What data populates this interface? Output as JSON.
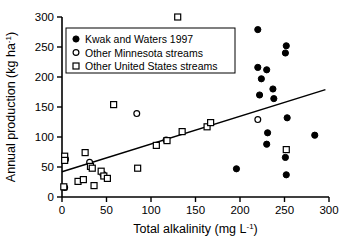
{
  "chart_data": {
    "type": "scatter",
    "title": "",
    "xlabel": "Total alkalinity (mg L-1)",
    "xlabel_base": "Total alkalinity (mg L",
    "xlabel_sup": "-1",
    "xlabel_tail": ")",
    "ylabel": "Annual production (kg ha-1)",
    "ylabel_base": "Annual production (kg ha",
    "ylabel_sup": "-1",
    "ylabel_tail": ")",
    "xlim": [
      0,
      300
    ],
    "ylim": [
      0,
      300
    ],
    "xticks": [
      0,
      50,
      100,
      150,
      200,
      250,
      300
    ],
    "yticks": [
      0,
      50,
      100,
      150,
      200,
      250,
      300
    ],
    "grid": false,
    "legend_position": "upper-left",
    "legend": [
      {
        "label": "Kwak and Waters 1997",
        "marker": "filled-circle"
      },
      {
        "label": "Other Minnesota streams",
        "marker": "open-circle"
      },
      {
        "label": "Other United States streams",
        "marker": "open-square"
      }
    ],
    "series": [
      {
        "name": "Kwak and Waters 1997",
        "marker": "filled-circle",
        "color": "#000000",
        "points": [
          [
            196,
            47
          ],
          [
            220,
            216
          ],
          [
            220,
            279
          ],
          [
            222,
            170
          ],
          [
            224,
            197
          ],
          [
            230,
            212
          ],
          [
            230,
            88
          ],
          [
            231,
            107
          ],
          [
            237,
            180
          ],
          [
            238,
            164
          ],
          [
            251,
            240
          ],
          [
            251,
            66
          ],
          [
            252,
            252
          ],
          [
            252,
            37
          ],
          [
            253,
            132
          ],
          [
            284,
            103
          ]
        ]
      },
      {
        "name": "Other Minnesota streams",
        "marker": "open-circle",
        "color": "#000000",
        "points": [
          [
            3,
            16
          ],
          [
            4,
            63
          ],
          [
            31,
            58
          ],
          [
            46,
            38
          ],
          [
            84,
            139
          ],
          [
            117,
            95
          ],
          [
            220,
            129
          ]
        ]
      },
      {
        "name": "Other United States streams",
        "marker": "open-square",
        "color": "#000000",
        "points": [
          [
            2,
            17
          ],
          [
            3,
            68
          ],
          [
            3,
            61
          ],
          [
            18,
            26
          ],
          [
            24,
            29
          ],
          [
            26,
            74
          ],
          [
            32,
            51
          ],
          [
            34,
            48
          ],
          [
            36,
            19
          ],
          [
            44,
            43
          ],
          [
            47,
            35
          ],
          [
            51,
            31
          ],
          [
            58,
            154
          ],
          [
            85,
            48
          ],
          [
            106,
            86
          ],
          [
            118,
            94
          ],
          [
            130,
            300
          ],
          [
            135,
            109
          ],
          [
            163,
            117
          ],
          [
            167,
            124
          ],
          [
            252,
            79
          ]
        ]
      }
    ],
    "trendline": {
      "x_start": 0,
      "y_start": 42,
      "x_end": 296,
      "y_end": 179,
      "color": "#000000"
    }
  }
}
